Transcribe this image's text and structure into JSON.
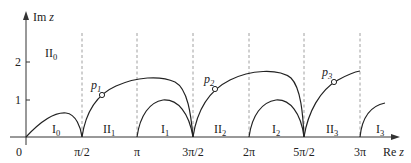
{
  "axes": {
    "y_label": "Im",
    "y_label_var": "z",
    "x_label": "Re",
    "x_label_var": "z",
    "origin_label": "0",
    "y_ticks": [
      "1",
      "2"
    ],
    "x_ticks": [
      "π/2",
      "π",
      "3π/2",
      "2π",
      "5π/2",
      "3π"
    ]
  },
  "regions": [
    {
      "base": "I",
      "sub": "0"
    },
    {
      "base": "II",
      "sub": "0"
    },
    {
      "base": "II",
      "sub": "1"
    },
    {
      "base": "I",
      "sub": "1"
    },
    {
      "base": "II",
      "sub": "2"
    },
    {
      "base": "I",
      "sub": "2"
    },
    {
      "base": "II",
      "sub": "3"
    },
    {
      "base": "I",
      "sub": "3"
    }
  ],
  "points": [
    {
      "base": "p",
      "sub": "1"
    },
    {
      "base": "p",
      "sub": "2"
    },
    {
      "base": "p",
      "sub": "3"
    }
  ]
}
